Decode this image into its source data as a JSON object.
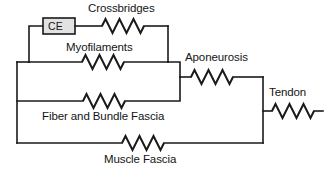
{
  "diagram": {
    "type": "schematic-circuit-analog",
    "background_color": "#ffffff",
    "line_color": "#1a1a1a",
    "box_fill_color": "#e2e2e2",
    "elements": {
      "ce": {
        "label": "CE",
        "kind": "contractile-element-box"
      },
      "crossbridges": {
        "label": "Crossbridges",
        "kind": "spring"
      },
      "myofilaments": {
        "label": "Myofilaments",
        "kind": "spring"
      },
      "aponeurosis": {
        "label": "Aponeurosis",
        "kind": "spring"
      },
      "tendon": {
        "label": "Tendon",
        "kind": "spring"
      },
      "fiber_bundle_fascia": {
        "label": "Fiber and Bundle Fascia",
        "kind": "spring"
      },
      "muscle_fascia": {
        "label": "Muscle Fascia",
        "kind": "spring"
      }
    }
  }
}
